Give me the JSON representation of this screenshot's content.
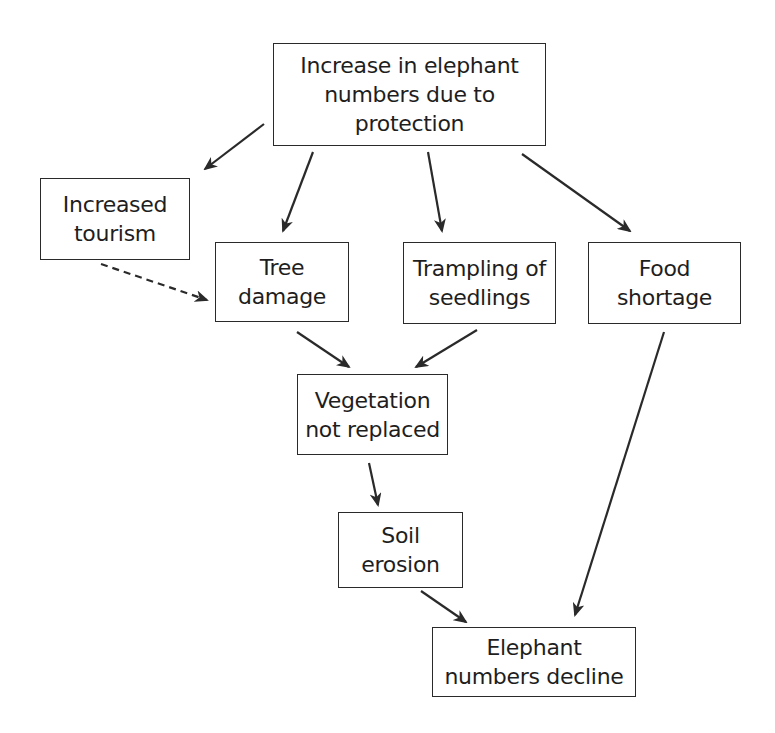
{
  "diagram": {
    "type": "flowchart",
    "nodes": [
      {
        "id": "increase",
        "lines": [
          "Increase in elephant",
          "numbers due to",
          "protection"
        ],
        "box": [
          273,
          43,
          273,
          103
        ]
      },
      {
        "id": "tourism",
        "lines": [
          "Increased",
          "tourism"
        ],
        "box": [
          40,
          178,
          150,
          82
        ]
      },
      {
        "id": "tree",
        "lines": [
          "Tree",
          "damage"
        ],
        "box": [
          215,
          242,
          134,
          80
        ]
      },
      {
        "id": "trampling",
        "lines": [
          "Trampling of",
          "seedlings"
        ],
        "box": [
          403,
          242,
          153,
          82
        ]
      },
      {
        "id": "food",
        "lines": [
          "Food",
          "shortage"
        ],
        "box": [
          588,
          242,
          153,
          82
        ]
      },
      {
        "id": "vegetation",
        "lines": [
          "Vegetation",
          "not replaced"
        ],
        "box": [
          297,
          374,
          151,
          81
        ]
      },
      {
        "id": "soil",
        "lines": [
          "Soil",
          "erosion"
        ],
        "box": [
          338,
          512,
          125,
          76
        ]
      },
      {
        "id": "decline",
        "lines": [
          "Elephant",
          "numbers decline"
        ],
        "box": [
          432,
          627,
          204,
          70
        ]
      }
    ],
    "edges": [
      {
        "from": "increase",
        "to": "tourism",
        "style": "solid",
        "points": [
          264,
          124,
          205,
          169
        ]
      },
      {
        "from": "increase",
        "to": "tree",
        "style": "solid",
        "points": [
          313,
          152,
          283,
          231
        ]
      },
      {
        "from": "increase",
        "to": "trampling",
        "style": "solid",
        "points": [
          428,
          152,
          442,
          231
        ]
      },
      {
        "from": "increase",
        "to": "food",
        "style": "solid",
        "points": [
          522,
          154,
          630,
          231
        ]
      },
      {
        "from": "tourism",
        "to": "tree",
        "style": "dashed",
        "points": [
          101,
          264,
          207,
          300
        ]
      },
      {
        "from": "tree",
        "to": "vegetation",
        "style": "solid",
        "points": [
          297,
          332,
          349,
          367
        ]
      },
      {
        "from": "trampling",
        "to": "vegetation",
        "style": "solid",
        "points": [
          477,
          330,
          416,
          367
        ]
      },
      {
        "from": "vegetation",
        "to": "soil",
        "style": "solid",
        "points": [
          369,
          463,
          378,
          505
        ]
      },
      {
        "from": "soil",
        "to": "decline",
        "style": "solid",
        "points": [
          421,
          591,
          466,
          622
        ]
      },
      {
        "from": "food",
        "to": "decline",
        "style": "solid",
        "points": [
          664,
          332,
          575,
          615
        ]
      }
    ],
    "colors": {
      "line": "#2a2a2a",
      "text": "#1e1e1e",
      "background": "#ffffff"
    }
  }
}
